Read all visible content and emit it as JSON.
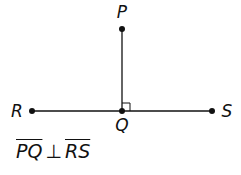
{
  "diagram": {
    "points": [
      {
        "name": "P",
        "x": 122,
        "y": 29,
        "label_x": 122,
        "label_y": 18
      },
      {
        "name": "Q",
        "x": 122,
        "y": 111,
        "label_x": 122,
        "label_y": 131
      },
      {
        "name": "R",
        "x": 32,
        "y": 111,
        "label_x": 17,
        "label_y": 117
      },
      {
        "name": "S",
        "x": 212,
        "y": 111,
        "label_x": 227,
        "label_y": 117
      }
    ],
    "segments": [
      {
        "from": "P",
        "to": "Q"
      },
      {
        "from": "R",
        "to": "S"
      }
    ],
    "right_angle_at": "Q",
    "labels": {
      "P": "P",
      "Q": "Q",
      "R": "R",
      "S": "S"
    },
    "statement": {
      "seg1": "PQ",
      "symbol": "⊥",
      "seg2": "RS"
    },
    "colors": {
      "stroke": "#111111",
      "background": "#ffffff"
    }
  }
}
